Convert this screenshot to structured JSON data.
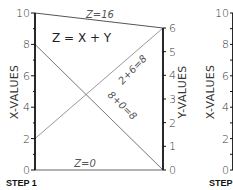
{
  "title": "Z = X + Y",
  "step_label": "STEP 1",
  "step_label_next": "STEP",
  "left_axis": {
    "title": "X-VALUES",
    "min": 0,
    "max": 10,
    "labels": [
      "0",
      "2",
      "4",
      "6",
      "8",
      "10"
    ],
    "label_values": [
      0,
      2,
      4,
      6,
      8,
      10
    ],
    "minor_step": 1
  },
  "right_axis": {
    "title": "Y-VALUES",
    "min": 0,
    "max": 6,
    "labels": [
      "0",
      "1",
      "2",
      "3",
      "4",
      "5",
      "6"
    ],
    "label_values": [
      0,
      1,
      2,
      3,
      4,
      5,
      6
    ]
  },
  "next_axis": {
    "title": "X-VALUES",
    "labels": [
      "0",
      "2",
      "4",
      "6",
      "8",
      "10"
    ],
    "label_values": [
      0,
      2,
      4,
      6,
      8,
      10
    ]
  },
  "lines": [
    {
      "name": "z-16-line",
      "x": 10,
      "y": 6,
      "label": "Z=16",
      "color": "#555555"
    },
    {
      "name": "z-0-line",
      "x": 0,
      "y": 0,
      "label": "Z=0",
      "color": "#999999"
    },
    {
      "name": "sum-2-6-line",
      "x": 2,
      "y": 6,
      "label": "2+6=8",
      "color": "#999999"
    },
    {
      "name": "sum-8-0-line",
      "x": 8,
      "y": 0,
      "label": "8+0=8",
      "color": "#777777"
    }
  ],
  "colors": {
    "axis": "#111111",
    "text": "#333333"
  }
}
